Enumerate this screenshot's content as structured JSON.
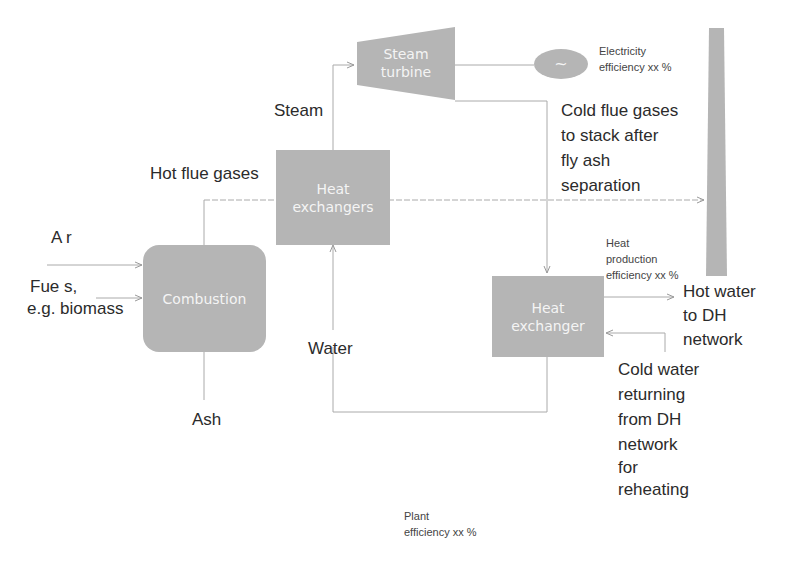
{
  "diagram": {
    "components": {
      "steam_turbine": "Steam turbine",
      "steam_turbine_l1": "Steam",
      "steam_turbine_l2": "turbine",
      "generator_symbol": "~",
      "heat_exchangers_l1": "Heat",
      "heat_exchangers_l2": "exchangers",
      "combustion": "Combustion",
      "heat_exchanger_l1": "Heat",
      "heat_exchanger_l2": "exchanger"
    },
    "labels": {
      "steam": "Steam",
      "hot_flue_gases": "Hot flue gases",
      "air": "A r",
      "fuels_l1": "Fue s,",
      "fuels_l2": "e.g. biomass",
      "ash": "Ash",
      "water": "Water",
      "cold_flue_l1": "Cold flue gases",
      "cold_flue_l2": "to stack after",
      "cold_flue_l3": "fly ash",
      "cold_flue_l4": "separation",
      "hot_water_l1": "Hot water",
      "hot_water_l2": "to DH",
      "hot_water_l3": "network",
      "cold_water_l1": "Cold water",
      "cold_water_l2": "returning",
      "cold_water_l3": "from DH",
      "cold_water_l4": "network",
      "cold_water_l5": "for",
      "cold_water_l6": "reheating"
    },
    "efficiencies": {
      "electricity_l1": "Electricity",
      "electricity_l2": "efficiency xx %",
      "heat_l1": "Heat",
      "heat_l2": "production",
      "heat_l3": "efficiency xx %",
      "plant_l1": "Plant",
      "plant_l2": "efficiency xx %"
    },
    "colors": {
      "box_fill": "#b5b5b5",
      "line": "#aaaaaa",
      "text": "#2b2b2b"
    }
  }
}
